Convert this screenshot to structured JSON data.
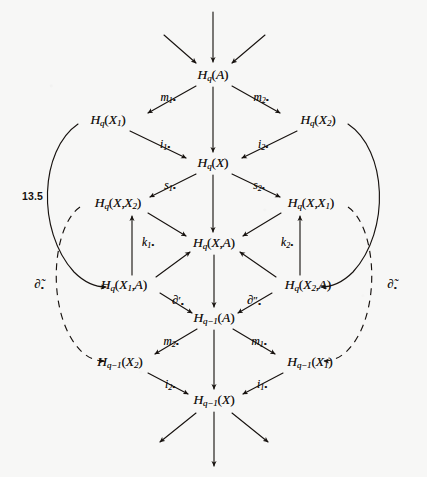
{
  "page": {
    "equation_number": "13.5",
    "background_color": "#f7f7f6",
    "ink_color": "#17120f",
    "width": 427,
    "height": 477
  },
  "diagram": {
    "type": "commutative-diagram",
    "nodes": [
      {
        "id": "hq_a",
        "label_html": "H<span class=\"sub\">q</span><span class=\"paren\">(</span>A<span class=\"paren\">)</span>",
        "plain": "H_q(A)",
        "x": 213,
        "y": 75
      },
      {
        "id": "hq_x1",
        "label_html": "H<span class=\"sub\">q</span><span class=\"paren\">(</span>X<span class=\"sub\">1</span><span class=\"paren\">)</span>",
        "plain": "H_q(X_1)",
        "x": 108,
        "y": 120
      },
      {
        "id": "hq_x2",
        "label_html": "H<span class=\"sub\">q</span><span class=\"paren\">(</span>X<span class=\"sub\">2</span><span class=\"paren\">)</span>",
        "plain": "H_q(X_2)",
        "x": 318,
        "y": 120
      },
      {
        "id": "hq_x",
        "label_html": "H<span class=\"sub\">q</span><span class=\"paren\">(</span>X<span class=\"paren\">)</span>",
        "plain": "H_q(X)",
        "x": 213,
        "y": 163
      },
      {
        "id": "hq_x_x2",
        "label_html": "H<span class=\"sub\">q</span><span class=\"paren\">(</span>X<span class=\"comma\">,</span>X<span class=\"sub\">2</span><span class=\"paren\">)</span>",
        "plain": "H_q(X,X_2)",
        "x": 118,
        "y": 203
      },
      {
        "id": "hq_x_x1",
        "label_html": "H<span class=\"sub\">q</span><span class=\"paren\">(</span>X<span class=\"comma\">,</span>X<span class=\"sub\">1</span><span class=\"paren\">)</span>",
        "plain": "H_q(X,X_1)",
        "x": 311,
        "y": 203
      },
      {
        "id": "hq_x_a",
        "label_html": "H<span class=\"sub\">q</span><span class=\"paren\">(</span>X<span class=\"comma\">,</span>A<span class=\"paren\">)</span>",
        "plain": "H_q(X,A)",
        "x": 214,
        "y": 243
      },
      {
        "id": "hq_x1_a",
        "label_html": "H<span class=\"sub\">q</span><span class=\"paren\">(</span>X<span class=\"sub\">1</span><span class=\"comma\">,</span>A<span class=\"paren\">)</span>",
        "plain": "H_q(X_1,A)",
        "x": 124,
        "y": 285
      },
      {
        "id": "hq_x2_a",
        "label_html": "H<span class=\"sub\">q</span><span class=\"paren\">(</span>X<span class=\"sub\">2</span><span class=\"comma\">,</span>A<span class=\"paren\">)</span>",
        "plain": "H_q(X_2,A)",
        "x": 308,
        "y": 285
      },
      {
        "id": "hqm1_a",
        "label_html": "H<span class=\"sub\">q&#8722;1</span><span class=\"paren\">(</span>A<span class=\"paren\">)</span>",
        "plain": "H_{q-1}(A)",
        "x": 214,
        "y": 318
      },
      {
        "id": "hqm1_x2",
        "label_html": "H<span class=\"sub\">q&#8722;1</span><span class=\"paren\">(</span>X<span class=\"sub\">2</span><span class=\"paren\">)</span>",
        "plain": "H_{q-1}(X_2)",
        "x": 120,
        "y": 362
      },
      {
        "id": "hqm1_x1",
        "label_html": "H<span class=\"sub\">q&#8722;1</span><span class=\"paren\">(</span>X<span class=\"sub\">1</span><span class=\"paren\">)</span>",
        "plain": "H_{q-1}(X_1)",
        "x": 310,
        "y": 362
      },
      {
        "id": "hqm1_x",
        "label_html": "H<span class=\"sub\">q&#8722;1</span><span class=\"paren\">(</span>X<span class=\"paren\">)</span>",
        "plain": "H_{q-1}(X)",
        "x": 214,
        "y": 400
      }
    ],
    "map_labels": [
      {
        "id": "m1",
        "label_html": "m<span class=\"sub\">1</span><span class=\"star\">&#8226;</span>",
        "plain": "m_1*",
        "x": 168,
        "y": 98
      },
      {
        "id": "m2",
        "label_html": "m<span class=\"sub\">2</span><span class=\"star\">&#8226;</span>",
        "plain": "m_2*",
        "x": 261,
        "y": 98
      },
      {
        "id": "i1_top",
        "label_html": "i<span class=\"sub\">1</span><span class=\"star\">&#8226;</span>",
        "plain": "i_1*",
        "x": 165,
        "y": 145
      },
      {
        "id": "i2_top",
        "label_html": "i<span class=\"sub\">2</span><span class=\"star\">&#8226;</span>",
        "plain": "i_2*",
        "x": 263,
        "y": 145
      },
      {
        "id": "s1",
        "label_html": "s<span class=\"sub\">1</span><span class=\"star\">&#8226;</span>",
        "plain": "s_1*",
        "x": 170,
        "y": 186
      },
      {
        "id": "s2",
        "label_html": "s<span class=\"sub\">2</span><span class=\"star\">&#8226;</span>",
        "plain": "s_2*",
        "x": 259,
        "y": 186
      },
      {
        "id": "k1",
        "label_html": "k<span class=\"sub\">1</span><span class=\"star\">&#8226;</span>",
        "plain": "k_1*",
        "x": 148,
        "y": 243
      },
      {
        "id": "k2",
        "label_html": "k<span class=\"sub\">2</span><span class=\"star\">&#8226;</span>",
        "plain": "k_2*",
        "x": 287,
        "y": 243
      },
      {
        "id": "del_p",
        "label_html": "<span class=\"bigdel\">&#8706;</span><span class=\"prime\">&#8242;</span><span class=\"star\">&#8226;</span>",
        "plain": "∂'_*",
        "x": 178,
        "y": 301
      },
      {
        "id": "del_pp",
        "label_html": "<span class=\"bigdel\">&#8706;</span><span class=\"prime\">&#8243;</span><span class=\"star\">&#8226;</span>",
        "plain": "∂''_*",
        "x": 254,
        "y": 301
      },
      {
        "id": "m2_bot",
        "label_html": "m<span class=\"sub\">2</span><span class=\"star\">&#8226;</span>",
        "plain": "m_2*",
        "x": 171,
        "y": 342
      },
      {
        "id": "m1_bot",
        "label_html": "m<span class=\"sub\">1</span><span class=\"star\">&#8226;</span>",
        "plain": "m_1*",
        "x": 259,
        "y": 342
      },
      {
        "id": "i2_bot",
        "label_html": "i<span class=\"sub\">2</span><span class=\"star\">&#8226;</span>",
        "plain": "i_2*",
        "x": 170,
        "y": 385
      },
      {
        "id": "i1_bot",
        "label_html": "i<span class=\"sub\">1</span><span class=\"star\">&#8226;</span>",
        "plain": "i_1*",
        "x": 262,
        "y": 385
      },
      {
        "id": "dtilde_l",
        "label_html": "<span class=\"bigdel\">&#8706;&#771;</span><span class=\"star\">&#8226;</span>",
        "plain": "∂̃_*",
        "x": 39,
        "y": 285
      },
      {
        "id": "dtilde_r",
        "label_html": "<span class=\"bigdel\">&#8706;&#771;</span><span class=\"star\">&#8226;</span>",
        "plain": "∂̃_*",
        "x": 392,
        "y": 285
      }
    ]
  }
}
